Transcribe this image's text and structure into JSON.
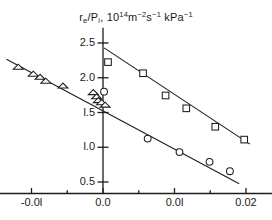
{
  "chart_data": {
    "type": "scatter",
    "title_parts": {
      "sym1": "r",
      "sub1": "e",
      "slash": "/P",
      "sub2": "i",
      "comma": ",  10",
      "exp1": "14",
      "unit1": "m",
      "exp2": "−2",
      "unit2": "s",
      "exp3": "−1",
      "unit3": " kPa",
      "exp4": "−1"
    },
    "xlabel": "",
    "ylabel": "",
    "xlim": [
      -0.0145,
      0.0235
    ],
    "ylim": [
      0.28,
      2.72
    ],
    "grid": false,
    "legend": "none",
    "xticks": [
      -0.01,
      0.0,
      0.01,
      0.02
    ],
    "xtick_labels": [
      "-0.0l",
      "0.0",
      "0.0l",
      "0.02"
    ],
    "xminor_ticks": [
      -0.005,
      0.005,
      0.015
    ],
    "yticks": [
      0.5,
      1.0,
      1.5,
      2.0,
      2.5
    ],
    "ytick_labels": [
      "0.5",
      "l.0",
      "l.5",
      "2.0",
      "2.5"
    ],
    "series": [
      {
        "name": "triangles",
        "marker": "triangle",
        "points": [
          {
            "x": -0.01185,
            "y": 2.155
          },
          {
            "x": -0.00975,
            "y": 2.055
          },
          {
            "x": -0.0088,
            "y": 2.01
          },
          {
            "x": -0.008,
            "y": 1.955
          },
          {
            "x": -0.0056,
            "y": 1.885
          },
          {
            "x": -0.00135,
            "y": 1.79
          },
          {
            "x": -0.0009,
            "y": 1.73
          },
          {
            "x": -0.00065,
            "y": 1.675
          },
          {
            "x": -0.0002,
            "y": 1.645
          },
          {
            "x": 0.0003,
            "y": 1.61
          }
        ]
      },
      {
        "name": "squares",
        "marker": "square",
        "points": [
          {
            "x": 0.0007,
            "y": 2.225
          },
          {
            "x": 0.0056,
            "y": 2.065
          },
          {
            "x": 0.00875,
            "y": 1.745
          },
          {
            "x": 0.01165,
            "y": 1.56
          },
          {
            "x": 0.0157,
            "y": 1.295
          },
          {
            "x": 0.01975,
            "y": 1.11
          }
        ]
      },
      {
        "name": "circles",
        "marker": "circle",
        "points": [
          {
            "x": 0.00015,
            "y": 1.8
          },
          {
            "x": 0.00625,
            "y": 1.125
          },
          {
            "x": 0.0107,
            "y": 0.93
          },
          {
            "x": 0.0149,
            "y": 0.79
          },
          {
            "x": 0.01775,
            "y": 0.655
          }
        ]
      }
    ],
    "fit_lines": [
      {
        "name": "upper-fit",
        "x1": 0.00015,
        "y1": 2.43,
        "x2": 0.02055,
        "y2": 1.045
      },
      {
        "name": "lower-fit",
        "x1": -0.0135,
        "y1": 2.265,
        "x2": 0.01905,
        "y2": 0.475
      }
    ]
  }
}
